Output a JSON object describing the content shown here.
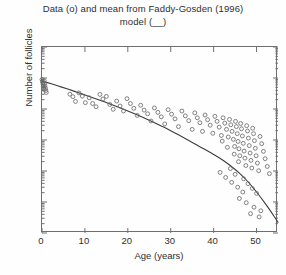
{
  "chart_data": {
    "type": "scatter",
    "title": "Data (o) and mean from Faddy-Gosden (1996) model (__)",
    "title_lines": [
      "Data (o) and mean from Faddy-Gosden (1996)",
      "model (__)"
    ],
    "xlabel": "Age (years)",
    "ylabel": "Number of follicles",
    "xlim": [
      0,
      55
    ],
    "ylim": [
      10,
      10000000
    ],
    "yscale": "log",
    "xscale": "linear",
    "xticks": [
      0,
      10,
      20,
      30,
      40,
      50
    ],
    "xtick_labels": [
      "0",
      "10",
      "20",
      "30",
      "40",
      "50"
    ],
    "yticks": [
      10,
      100,
      1000,
      10000,
      100000,
      1000000,
      10000000
    ],
    "ytick_labels": [
      "10",
      "10",
      "10",
      "10",
      "10",
      "10",
      "10"
    ],
    "ytick_exponents": [
      "1",
      "2",
      "3",
      "4",
      "5",
      "6",
      "7"
    ],
    "grid": false,
    "legend": "none",
    "marker": "open-circle",
    "marker_color": "#6b6b6b",
    "line_color": "#3c3c3c",
    "axis_color": "#6f6f6f",
    "background": "#ffffff",
    "series": [
      {
        "name": "Data (o)",
        "type": "scatter",
        "points": [
          [
            0.0,
            900000
          ],
          [
            0.1,
            780000
          ],
          [
            0.2,
            700000
          ],
          [
            0.25,
            620000
          ],
          [
            0.3,
            540000
          ],
          [
            0.35,
            480000
          ],
          [
            0.4,
            430000
          ],
          [
            0.5,
            820000
          ],
          [
            0.6,
            660000
          ],
          [
            0.7,
            560000
          ],
          [
            0.8,
            470000
          ],
          [
            0.9,
            395000
          ],
          [
            1.0,
            340000
          ],
          [
            6.5,
            300000
          ],
          [
            7.2,
            250000
          ],
          [
            7.8,
            175000
          ],
          [
            8.6,
            330000
          ],
          [
            9.4,
            260000
          ],
          [
            10.1,
            160000
          ],
          [
            11.0,
            230000
          ],
          [
            11.8,
            150000
          ],
          [
            12.6,
            118000
          ],
          [
            13.5,
            295000
          ],
          [
            14.2,
            210000
          ],
          [
            15.0,
            255000
          ],
          [
            15.8,
            140000
          ],
          [
            16.6,
            98000
          ],
          [
            17.4,
            180000
          ],
          [
            18.2,
            125000
          ],
          [
            19.0,
            86000
          ],
          [
            19.8,
            215000
          ],
          [
            20.6,
            150000
          ],
          [
            21.4,
            105000
          ],
          [
            22.2,
            62000
          ],
          [
            23.0,
            132000
          ],
          [
            23.8,
            92000
          ],
          [
            24.6,
            70000
          ],
          [
            25.4,
            41000
          ],
          [
            26.2,
            108000
          ],
          [
            27.0,
            78000
          ],
          [
            27.8,
            56000
          ],
          [
            28.6,
            33000
          ],
          [
            29.4,
            95000
          ],
          [
            30.2,
            68000
          ],
          [
            31.0,
            48000
          ],
          [
            31.8,
            27000
          ],
          [
            32.6,
            86000
          ],
          [
            33.4,
            60000
          ],
          [
            34.2,
            42000
          ],
          [
            35.0,
            22000
          ],
          [
            35.6,
            75000
          ],
          [
            36.2,
            52000
          ],
          [
            36.8,
            36000
          ],
          [
            37.4,
            19000
          ],
          [
            38.0,
            64000
          ],
          [
            38.6,
            45000
          ],
          [
            39.2,
            30000
          ],
          [
            39.8,
            16500
          ],
          [
            40.3,
            58000
          ],
          [
            40.8,
            40000
          ],
          [
            41.3,
            26000
          ],
          [
            41.8,
            14000
          ],
          [
            42.2,
            52000
          ],
          [
            42.6,
            35000
          ],
          [
            43.0,
            22000
          ],
          [
            43.4,
            12500
          ],
          [
            43.7,
            46000
          ],
          [
            44.0,
            31000
          ],
          [
            44.3,
            19000
          ],
          [
            44.6,
            10500
          ],
          [
            44.9,
            6200
          ],
          [
            45.1,
            40000
          ],
          [
            45.3,
            27000
          ],
          [
            45.5,
            16000
          ],
          [
            45.7,
            9000
          ],
          [
            45.9,
            5200
          ],
          [
            46.1,
            3100
          ],
          [
            46.3,
            34000
          ],
          [
            46.5,
            23000
          ],
          [
            46.7,
            13500
          ],
          [
            46.9,
            7800
          ],
          [
            47.1,
            4400
          ],
          [
            47.3,
            2600
          ],
          [
            47.5,
            1500
          ],
          [
            47.7,
            29000
          ],
          [
            47.9,
            19500
          ],
          [
            48.1,
            11500
          ],
          [
            48.3,
            6600
          ],
          [
            48.5,
            3800
          ],
          [
            48.7,
            2200
          ],
          [
            48.9,
            1250
          ],
          [
            49.1,
            24000
          ],
          [
            49.3,
            16000
          ],
          [
            49.5,
            9500
          ],
          [
            49.7,
            5400
          ],
          [
            49.9,
            3100
          ],
          [
            50.2,
            1800
          ],
          [
            50.5,
            1020
          ],
          [
            50.8,
            13000
          ],
          [
            51.2,
            7600
          ],
          [
            51.6,
            4300
          ],
          [
            52.0,
            2500
          ],
          [
            52.5,
            1400
          ],
          [
            53.0,
            820
          ],
          [
            41.5,
            900
          ],
          [
            42.8,
            620
          ],
          [
            44.2,
            430
          ],
          [
            45.6,
            300
          ],
          [
            46.8,
            210
          ],
          [
            43.9,
            1200
          ],
          [
            45.0,
            780
          ],
          [
            47.0,
            560
          ],
          [
            48.0,
            390
          ],
          [
            49.0,
            275
          ],
          [
            50.0,
            190
          ],
          [
            46.0,
            130
          ],
          [
            47.6,
            95
          ],
          [
            49.4,
            68
          ],
          [
            51.0,
            52
          ],
          [
            48.6,
            42
          ],
          [
            50.6,
            33
          ],
          [
            45.8,
            2000
          ],
          [
            44.8,
            3500
          ],
          [
            43.2,
            5800
          ],
          [
            42.0,
            9200
          ]
        ]
      },
      {
        "name": "Faddy-Gosden (1996) model mean",
        "type": "line",
        "points": [
          [
            0,
            800000
          ],
          [
            2,
            660000
          ],
          [
            4,
            540000
          ],
          [
            6,
            440000
          ],
          [
            8,
            355000
          ],
          [
            10,
            285000
          ],
          [
            12,
            228000
          ],
          [
            14,
            181000
          ],
          [
            16,
            142000
          ],
          [
            18,
            111000
          ],
          [
            20,
            86000
          ],
          [
            22,
            66000
          ],
          [
            24,
            50000
          ],
          [
            26,
            37500
          ],
          [
            28,
            27500
          ],
          [
            30,
            20000
          ],
          [
            32,
            14200
          ],
          [
            34,
            10000
          ],
          [
            36,
            7000
          ],
          [
            38,
            4900
          ],
          [
            40,
            3400
          ],
          [
            42,
            2300
          ],
          [
            44,
            1450
          ],
          [
            46,
            850
          ],
          [
            48,
            450
          ],
          [
            50,
            210
          ],
          [
            52,
            90
          ],
          [
            54,
            36
          ],
          [
            55,
            22
          ]
        ]
      }
    ]
  }
}
